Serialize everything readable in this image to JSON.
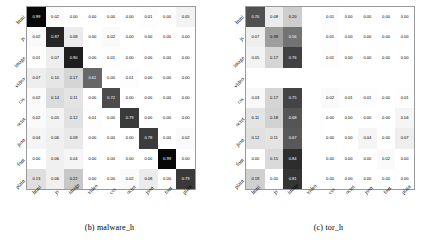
{
  "figure": {
    "panels": [
      {
        "id": "malware_h",
        "caption": "(b)  malware_h",
        "chart_index": 0
      },
      {
        "id": "tor_h",
        "caption": "(c)  tor_h",
        "chart_index": 1
      }
    ]
  },
  "chart_data": [
    {
      "type": "heatmap",
      "title": "(b)  malware_h",
      "xlabel": "",
      "ylabel": "",
      "grid": false,
      "legend": "none",
      "colormap": "greys",
      "vmin": 0.0,
      "vmax": 1.0,
      "categories": [
        "html",
        "js",
        "image",
        "video",
        "css",
        "octet",
        "json",
        "font",
        "plain"
      ],
      "x_tick_labels": [
        "html",
        "js",
        "image",
        "video",
        "css",
        "octet",
        "json",
        "font",
        "plain"
      ],
      "y_tick_labels": [
        "html",
        "js",
        "image",
        "video",
        "css",
        "octet",
        "json",
        "font",
        "plain"
      ],
      "values": [
        [
          0.99,
          0.02,
          0.0,
          0.0,
          0.0,
          0.0,
          0.01,
          0.0,
          0.05
        ],
        [
          0.02,
          0.87,
          0.08,
          0.0,
          0.02,
          0.0,
          0.0,
          0.0,
          0.0
        ],
        [
          0.01,
          0.07,
          0.9,
          0.0,
          0.01,
          0.0,
          0.0,
          0.0,
          0.0
        ],
        [
          0.07,
          0.1,
          0.17,
          0.61,
          0.0,
          0.01,
          0.0,
          0.0,
          0.0
        ],
        [
          0.02,
          0.14,
          0.11,
          0.0,
          0.72,
          0.0,
          0.0,
          0.0,
          0.0
        ],
        [
          0.02,
          0.05,
          0.12,
          0.01,
          0.0,
          0.79,
          0.0,
          0.0,
          0.0
        ],
        [
          0.04,
          0.06,
          0.09,
          0.0,
          0.0,
          0.0,
          0.78,
          0.0,
          0.02
        ],
        [
          0.0,
          0.06,
          0.04,
          0.0,
          0.0,
          0.0,
          0.0,
          0.99,
          0.0
        ],
        [
          0.13,
          0.06,
          0.22,
          0.0,
          0.0,
          0.02,
          0.08,
          0.0,
          0.79
        ]
      ]
    },
    {
      "type": "heatmap",
      "title": "(c)  tor_h",
      "xlabel": "",
      "ylabel": "",
      "grid": false,
      "legend": "none",
      "colormap": "greys",
      "vmin": 0.0,
      "vmax": 1.0,
      "categories": [
        "html",
        "js",
        "image",
        "video",
        "css",
        "octet",
        "json",
        "font",
        "plain"
      ],
      "x_tick_labels": [
        "html",
        "js",
        "image",
        "video",
        "css",
        "octet",
        "json",
        "font",
        "plain"
      ],
      "y_tick_labels": [
        "html",
        "js",
        "image",
        "video",
        "css",
        "octet",
        "json",
        "font",
        "plain"
      ],
      "values": [
        [
          0.7,
          0.08,
          0.2,
          null,
          0.01,
          0.0,
          0.0,
          0.0,
          0.0
        ],
        [
          0.07,
          0.39,
          0.56,
          null,
          0.01,
          0.0,
          0.0,
          0.0,
          0.0
        ],
        [
          0.05,
          0.17,
          0.76,
          null,
          0.01,
          0.0,
          0.0,
          0.0,
          0.0
        ],
        [
          null,
          null,
          null,
          null,
          null,
          null,
          null,
          null,
          null
        ],
        [
          0.03,
          0.17,
          0.75,
          null,
          0.02,
          0.01,
          0.01,
          0.0,
          0.01
        ],
        [
          0.11,
          0.18,
          0.68,
          null,
          0.0,
          0.0,
          0.0,
          0.0,
          0.04
        ],
        [
          0.12,
          0.11,
          0.67,
          null,
          0.0,
          0.0,
          0.04,
          0.0,
          0.07
        ],
        [
          0.0,
          0.15,
          0.84,
          null,
          0.0,
          0.0,
          0.0,
          0.02,
          0.0
        ],
        [
          0.19,
          0.0,
          0.81,
          null,
          0.0,
          0.0,
          0.0,
          0.0,
          0.0
        ]
      ]
    }
  ]
}
